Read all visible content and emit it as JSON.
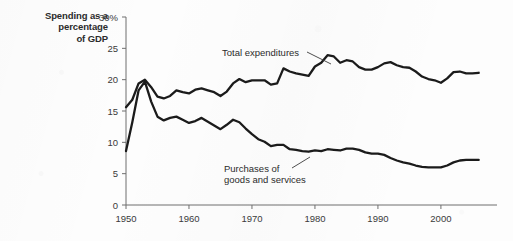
{
  "chart_data": {
    "type": "line",
    "title": "Spending as a percentage of GDP",
    "title_lines": [
      "Spending as a",
      "percentage",
      "of GDP"
    ],
    "xlabel": "",
    "ylabel": "Spending as a percentage of GDP",
    "xlim": [
      1950,
      2007
    ],
    "ylim": [
      0,
      30
    ],
    "y_ticks": [
      0,
      5,
      10,
      15,
      20,
      25,
      30
    ],
    "y_tick_labels": [
      "0",
      "5",
      "10",
      "15",
      "20",
      "25",
      "30%"
    ],
    "x_ticks": [
      1950,
      1960,
      1970,
      1980,
      1990,
      2000
    ],
    "x_tick_labels": [
      "1950",
      "1960",
      "1970",
      "1980",
      "1990",
      "2000"
    ],
    "grid": false,
    "legend_position": "inline-annotations",
    "annotations": [
      {
        "text": "Total expenditures",
        "lines": [
          "Total expenditures"
        ],
        "x": 1968,
        "y": 25.3
      },
      {
        "text": "Purchases of goods and services",
        "lines": [
          "Purchases of",
          "goods and services"
        ],
        "x": 1966,
        "y": 6.0
      }
    ],
    "series": [
      {
        "name": "Total expenditures",
        "x": [
          1950,
          1951,
          1952,
          1953,
          1954,
          1955,
          1956,
          1957,
          1958,
          1959,
          1960,
          1961,
          1962,
          1963,
          1964,
          1965,
          1966,
          1967,
          1968,
          1969,
          1970,
          1971,
          1972,
          1973,
          1974,
          1975,
          1976,
          1977,
          1978,
          1979,
          1980,
          1981,
          1982,
          1983,
          1984,
          1985,
          1986,
          1987,
          1988,
          1989,
          1990,
          1991,
          1992,
          1993,
          1994,
          1995,
          1996,
          1997,
          1998,
          1999,
          2000,
          2001,
          2002,
          2003,
          2004,
          2005,
          2006
        ],
        "values": [
          15.6,
          16.8,
          19.4,
          20.0,
          18.8,
          17.3,
          17.0,
          17.4,
          18.3,
          18.0,
          17.8,
          18.4,
          18.6,
          18.3,
          18.0,
          17.4,
          18.1,
          19.4,
          20.1,
          19.6,
          19.9,
          19.9,
          19.9,
          19.2,
          19.4,
          21.8,
          21.3,
          21.0,
          20.8,
          20.6,
          22.1,
          22.7,
          23.9,
          23.7,
          22.7,
          23.1,
          22.9,
          22.0,
          21.6,
          21.6,
          22.0,
          22.6,
          22.8,
          22.3,
          22.0,
          21.9,
          21.3,
          20.5,
          20.1,
          19.9,
          19.5,
          20.2,
          21.2,
          21.3,
          21.0,
          21.0,
          21.1
        ]
      },
      {
        "name": "Purchases of goods and services",
        "x": [
          1950,
          1951,
          1952,
          1953,
          1954,
          1955,
          1956,
          1957,
          1958,
          1959,
          1960,
          1961,
          1962,
          1963,
          1964,
          1965,
          1966,
          1967,
          1968,
          1969,
          1970,
          1971,
          1972,
          1973,
          1974,
          1975,
          1976,
          1977,
          1978,
          1979,
          1980,
          1981,
          1982,
          1983,
          1984,
          1985,
          1986,
          1987,
          1988,
          1989,
          1990,
          1991,
          1992,
          1993,
          1994,
          1995,
          1996,
          1997,
          1998,
          1999,
          2000,
          2001,
          2002,
          2003,
          2004,
          2005,
          2006
        ],
        "values": [
          8.6,
          13.2,
          18.3,
          19.7,
          16.5,
          14.1,
          13.5,
          13.9,
          14.1,
          13.6,
          13.1,
          13.4,
          13.9,
          13.3,
          12.7,
          12.1,
          12.8,
          13.6,
          13.2,
          12.2,
          11.3,
          10.5,
          10.1,
          9.4,
          9.6,
          9.6,
          8.9,
          8.8,
          8.6,
          8.5,
          8.7,
          8.6,
          8.9,
          8.8,
          8.7,
          9.0,
          9.0,
          8.8,
          8.4,
          8.2,
          8.2,
          8.0,
          7.5,
          7.1,
          6.8,
          6.6,
          6.3,
          6.1,
          6.0,
          6.0,
          6.0,
          6.3,
          6.8,
          7.1,
          7.2,
          7.2,
          7.2
        ]
      }
    ]
  },
  "colors": {
    "line": "#1b1b1b",
    "axis": "#6f6f6f",
    "text": "#2b2b2b",
    "background": "#fdfdfd"
  }
}
